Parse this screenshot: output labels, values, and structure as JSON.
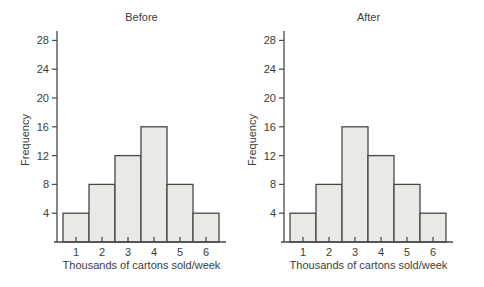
{
  "page": {
    "background": "#ffffff"
  },
  "colors": {
    "bar_fill": "#e9e9e6",
    "bar_stroke": "#474747",
    "axis": "#474747",
    "text": "#3c3c3c"
  },
  "chart_data": [
    {
      "type": "bar",
      "title": "Before",
      "categories": [
        "1",
        "2",
        "3",
        "4",
        "5",
        "6"
      ],
      "values": [
        4,
        8,
        12,
        16,
        8,
        4
      ],
      "xlabel": "Thousands of cartons sold/week",
      "ylabel": "Frequency",
      "yticks": [
        4,
        8,
        12,
        16,
        20,
        24,
        28
      ],
      "ylim": [
        0,
        30
      ],
      "grid": false,
      "legend": "none"
    },
    {
      "type": "bar",
      "title": "After",
      "categories": [
        "1",
        "2",
        "3",
        "4",
        "5",
        "6"
      ],
      "values": [
        4,
        8,
        16,
        12,
        8,
        4
      ],
      "xlabel": "Thousands of cartons sold/week",
      "ylabel": "Frequency",
      "yticks": [
        4,
        8,
        12,
        16,
        20,
        24,
        28
      ],
      "ylim": [
        0,
        30
      ],
      "grid": false,
      "legend": "none"
    }
  ]
}
